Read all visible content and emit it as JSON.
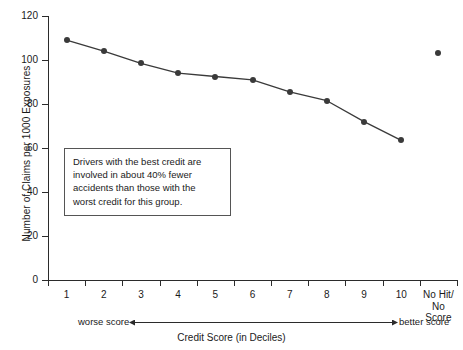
{
  "chart_data": {
    "type": "line",
    "title": "",
    "xlabel": "Credit Score (in Deciles)",
    "ylabel": "Number of Claims per 1000 Exposures",
    "categories": [
      "1",
      "2",
      "3",
      "4",
      "5",
      "6",
      "7",
      "8",
      "9",
      "10",
      "No Hit/\nNo Score"
    ],
    "series": [
      {
        "name": "Claims per 1000 Exposures",
        "values": [
          109,
          104,
          98.5,
          94,
          92.5,
          91,
          85.5,
          81.5,
          72,
          63.5,
          null
        ],
        "connected": true
      },
      {
        "name": "No Hit/No Score",
        "values": [
          null,
          null,
          null,
          null,
          null,
          null,
          null,
          null,
          null,
          null,
          103
        ],
        "connected": false
      }
    ],
    "ylim": [
      0,
      120
    ],
    "y_ticks": [
      0,
      20,
      40,
      60,
      80,
      100,
      120
    ],
    "grid": false,
    "legend": "none",
    "marker_color": "#3a3a3a",
    "line_color": "#3a3a3a"
  },
  "annotation": {
    "lines": [
      "Drivers with the best credit are",
      "involved in about 40% fewer",
      "accidents than those with the",
      "worst credit for this group."
    ]
  },
  "direction_scale": {
    "left_label": "worse score",
    "right_label": "better score"
  }
}
